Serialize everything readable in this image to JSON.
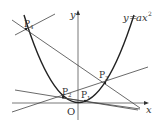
{
  "diagram": {
    "curve_label": "y=ax²",
    "curve_label_parts": {
      "lhs": "y",
      "eq": "=",
      "a": "a",
      "x": "x",
      "exp": "2"
    },
    "axes": {
      "x_label": "x",
      "y_label": "y",
      "origin_label": "O"
    },
    "points": [
      {
        "name": "P1",
        "base": "P",
        "sub": "1"
      },
      {
        "name": "P2",
        "base": "P",
        "sub": "2"
      },
      {
        "name": "P3",
        "base": "P",
        "sub": "3"
      },
      {
        "name": "P4",
        "base": "P",
        "sub": "4"
      }
    ],
    "colors": {
      "stroke": "#333333",
      "background": "#ffffff"
    }
  }
}
